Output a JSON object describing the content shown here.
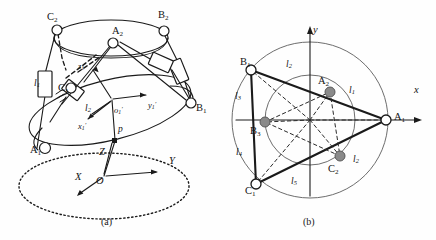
{
  "figure": {
    "panels": [
      {
        "id": "a",
        "caption": "(a)",
        "description": "3D perspective view of parallel manipulator"
      },
      {
        "id": "b",
        "caption": "(b)",
        "description": "Top projection view with link lengths"
      }
    ]
  },
  "panel_a": {
    "caption": "(a)",
    "joints": [
      {
        "name": "C2",
        "letter": "C",
        "sub": "2",
        "x": 47,
        "y": 12
      },
      {
        "name": "A2",
        "letter": "A",
        "sub": "2",
        "x": 112,
        "y": 26
      },
      {
        "name": "B2",
        "letter": "B",
        "sub": "2",
        "x": 158,
        "y": 10
      },
      {
        "name": "C1",
        "letter": "C",
        "sub": "1",
        "x": 58,
        "y": 83
      },
      {
        "name": "B1",
        "letter": "B",
        "sub": "1",
        "x": 196,
        "y": 103
      },
      {
        "name": "A1",
        "letter": "A",
        "sub": "1",
        "x": 30,
        "y": 145
      }
    ],
    "links": [
      {
        "name": "l1",
        "letter": "l",
        "sub": "1",
        "x": 34,
        "y": 79
      },
      {
        "name": "l2",
        "letter": "l",
        "sub": "2",
        "x": 85,
        "y": 104
      }
    ],
    "moving_frame": {
      "origin": {
        "name": "o1p",
        "letter": "o",
        "sub": "1",
        "prime": "′",
        "x": 114,
        "y": 106
      },
      "x_axis": {
        "name": "x1p",
        "letter": "x",
        "sub": "1",
        "prime": "′",
        "x": 78,
        "y": 122
      },
      "y_axis": {
        "name": "y1p",
        "letter": "y",
        "sub": "1",
        "prime": "′",
        "x": 148,
        "y": 101
      },
      "z_axis": {
        "name": "z1p",
        "letter": "z",
        "sub": "1",
        "prime": "′",
        "x": 78,
        "y": 62
      }
    },
    "point_p": {
      "name": "p",
      "letter": "p",
      "x": 118,
      "y": 125
    },
    "base_frame": {
      "origin": {
        "name": "O",
        "letter": "O",
        "x": 96,
        "y": 176
      },
      "X_axis": {
        "name": "X",
        "letter": "X",
        "x": 75,
        "y": 172
      },
      "Y_axis": {
        "name": "Y",
        "letter": "Y",
        "x": 169,
        "y": 156
      },
      "Z_axis": {
        "name": "Z",
        "letter": "Z",
        "x": 99,
        "y": 147
      }
    }
  },
  "panel_b": {
    "caption": "(b)",
    "axes": {
      "x_label": {
        "name": "x",
        "letter": "x",
        "x": 196,
        "y": 85
      },
      "y_label": {
        "name": "y",
        "letter": "y",
        "x": 95,
        "y": 25
      }
    },
    "joints": [
      {
        "name": "B1",
        "letter": "B",
        "sub": "1",
        "x": 22,
        "y": 57,
        "style": "open"
      },
      {
        "name": "A2",
        "letter": "A",
        "sub": "2",
        "x": 100,
        "y": 76,
        "style": "filled"
      },
      {
        "name": "A1",
        "letter": "A",
        "sub": "1",
        "x": 166,
        "y": 112,
        "style": "open"
      },
      {
        "name": "B3",
        "letter": "B",
        "sub": "3",
        "x": 32,
        "y": 126,
        "style": "filled"
      },
      {
        "name": "C2",
        "letter": "C",
        "sub": "2",
        "x": 110,
        "y": 164,
        "style": "filled"
      },
      {
        "name": "C1",
        "letter": "C",
        "sub": "1",
        "x": 27,
        "y": 186,
        "style": "open"
      }
    ],
    "links": [
      {
        "name": "l1",
        "letter": "l",
        "sub": "1",
        "x": 131,
        "y": 86
      },
      {
        "name": "l2",
        "letter": "l",
        "sub": "2",
        "x": 68,
        "y": 60
      },
      {
        "name": "l3",
        "letter": "l",
        "sub": "3",
        "x": 17,
        "y": 92
      },
      {
        "name": "l4",
        "letter": "l",
        "sub": "4",
        "x": 18,
        "y": 148
      },
      {
        "name": "l5",
        "letter": "l",
        "sub": "5",
        "x": 73,
        "y": 177
      },
      {
        "name": "l2b",
        "letter": "l",
        "sub": "2",
        "x": 135,
        "y": 155
      }
    ]
  },
  "colors": {
    "stroke": "#1a1a1a",
    "light_stroke": "#5a5a5a",
    "joint_fill_open": "#ffffff",
    "joint_fill_solid": "#8a8a8a",
    "background": "#fefefe"
  }
}
